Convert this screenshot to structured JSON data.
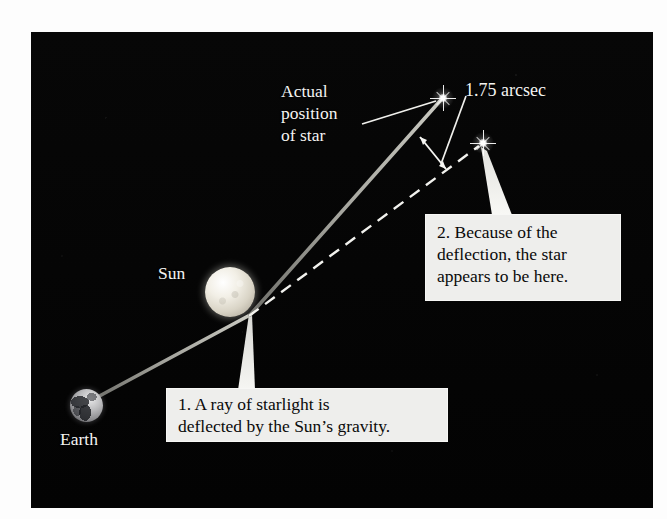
{
  "figure": {
    "panel_background": "#050505",
    "callout_background": "#eeeeec",
    "ray_color": "#9a9a94",
    "apparent_line_color": "#f2f2ee"
  },
  "labels": {
    "actual_position": "Actual\nposition\nof star",
    "deflection_angle": "1.75 arcsec",
    "sun": "Sun",
    "earth": "Earth"
  },
  "callouts": [
    {
      "id": "callout-1",
      "number": "1.",
      "text": "1. A ray of starlight is\ndeflected by the Sun’s gravity."
    },
    {
      "id": "callout-2",
      "number": "2.",
      "text": "2. Because of the\ndeflection, the star\nappears to be here."
    }
  ],
  "bodies": [
    {
      "name": "sun",
      "label": "Sun",
      "cx": 230,
      "cy": 292,
      "r": 25
    },
    {
      "name": "earth",
      "label": "Earth",
      "cx": 86,
      "cy": 405,
      "r": 16
    }
  ],
  "stars": [
    {
      "name": "actual-star",
      "role": "actual position of star",
      "cx": 443,
      "cy": 98
    },
    {
      "name": "apparent-star",
      "role": "apparent position of star",
      "cx": 483,
      "cy": 143
    }
  ],
  "geometry": {
    "light_ray_path": "Earth (86,405) -> bend at Sun limb (250,315) -> actual star (443,98)",
    "apparent_sightline": "bend point (250,315) -> apparent star (483,143) (dashed)",
    "deflection_arrow": "double-headed arrow from (419,136) to (447,170)",
    "arcsec_leader": "from text (463,95) to (443,163)",
    "actual_label_leader": "from text (363,124) to star (437,101)"
  },
  "icons": {
    "actual_star": "star-sparkle-icon",
    "apparent_star": "star-sparkle-icon",
    "sun": "sun-sphere-icon",
    "earth": "earth-globe-icon",
    "deflection_arrow": "double-arrow-icon"
  }
}
